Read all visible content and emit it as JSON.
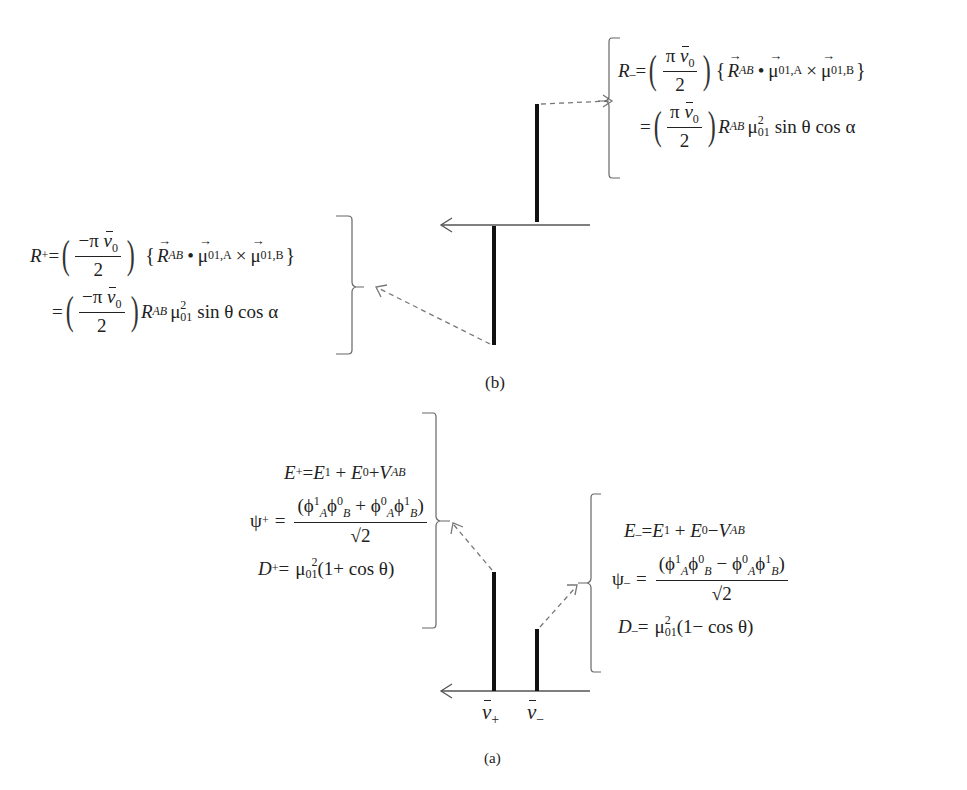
{
  "panel_b": {
    "caption": "(b)",
    "r_minus": {
      "lhs": "R",
      "lhs_sub": "_",
      "eq": "=",
      "frac_num_prefix": "π",
      "nu": "ν",
      "nu_sub": "0",
      "frac_den": "2",
      "R": "R",
      "R_sub": "AB",
      "dot": "•",
      "mu": "μ",
      "mu_sub_a": "01,A",
      "times": "×",
      "mu_sub_b": "01,B",
      "line2_eq": "=",
      "mu_sub": "01",
      "mu_sup": "2",
      "trig": "sin θ cos α"
    },
    "r_plus": {
      "lhs": "R",
      "lhs_sub": "+",
      "eq": "=",
      "frac_num_prefix": "−π",
      "nu": "ν",
      "nu_sub": "0",
      "frac_den": "2",
      "R": "R",
      "R_sub": "AB",
      "dot": "•",
      "mu": "μ",
      "mu_sub_a": "01,A",
      "times": "×",
      "mu_sub_b": "01,B",
      "line2_eq": "=",
      "mu_sub": "01",
      "mu_sup": "2",
      "trig": "sin θ cos α"
    }
  },
  "panel_a": {
    "caption": "(a)",
    "tick_labels": [
      {
        "symbol": "ν",
        "sub": "+"
      },
      {
        "symbol": "ν",
        "sub": "−"
      }
    ],
    "plus_state": {
      "E_lhs": "E",
      "E_sub": " +",
      "E_rhs_1": "E",
      "E_rhs_1_sup": "1",
      "plus": " + ",
      "E_rhs_2": "E",
      "E_rhs_2_sup": "0",
      "op": "+",
      "V": "V",
      "V_sub": "AB",
      "psi_lhs": "ψ",
      "psi_sub": "+",
      "psi_num": "(ϕ",
      "psi_op": " + ",
      "psi_den": "√2",
      "D_lhs": "D",
      "D_sub": "+",
      "mu": "μ",
      "mu_sub": "01",
      "mu_sup": "2",
      "D_rhs": "(1+ cos θ)"
    },
    "minus_state": {
      "E_lhs": "E",
      "E_sub": "_",
      "E_rhs_1": "E",
      "E_rhs_1_sup": "1",
      "plus": " + ",
      "E_rhs_2": "E",
      "E_rhs_2_sup": "0",
      "op": "−",
      "V": "V",
      "V_sub": "AB",
      "psi_lhs": "ψ",
      "psi_sub": "_",
      "psi_num": "(ϕ",
      "psi_op": " − ",
      "psi_den": "√2",
      "D_lhs": "D",
      "D_sub": "_",
      "mu": "μ",
      "mu_sub": "01",
      "mu_sup": "2",
      "D_rhs": "(1− cos θ)"
    }
  },
  "colors": {
    "stick": "#111111",
    "axis": "#555555",
    "dashed": "#777777",
    "bracket": "#666666"
  }
}
